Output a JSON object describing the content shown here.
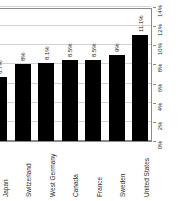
{
  "chart_data": {
    "type": "bar",
    "title": "",
    "subtitle": "",
    "xlabel": "",
    "ylabel": "",
    "orientation": "rotated-90",
    "grid": true,
    "legend": null,
    "ylim": [
      0,
      14
    ],
    "categories": [
      "Great Britain",
      "Japan",
      "Switzerland",
      "West Germany",
      "Canada",
      "France",
      "Sweden",
      "United States"
    ],
    "values": [
      6.2,
      6.7,
      8,
      8.1,
      8.5,
      8.5,
      9,
      11.1
    ],
    "value_labels": [
      "6.2%",
      "6.7%",
      "8%",
      "8.1%",
      "8.5%",
      "8.5%",
      "9%",
      "11.1%"
    ],
    "tick_values": [
      0,
      2,
      4,
      6,
      8,
      10,
      12,
      14
    ],
    "tick_labels": [
      "0%",
      "2%",
      "4%",
      "6%",
      "8%",
      "10%",
      "12%",
      "14%"
    ],
    "bar_color": "#000000",
    "grid_color": "#d2d2d2",
    "axis_color": "#8a8a8a",
    "text_color": "#2a2a2a"
  }
}
